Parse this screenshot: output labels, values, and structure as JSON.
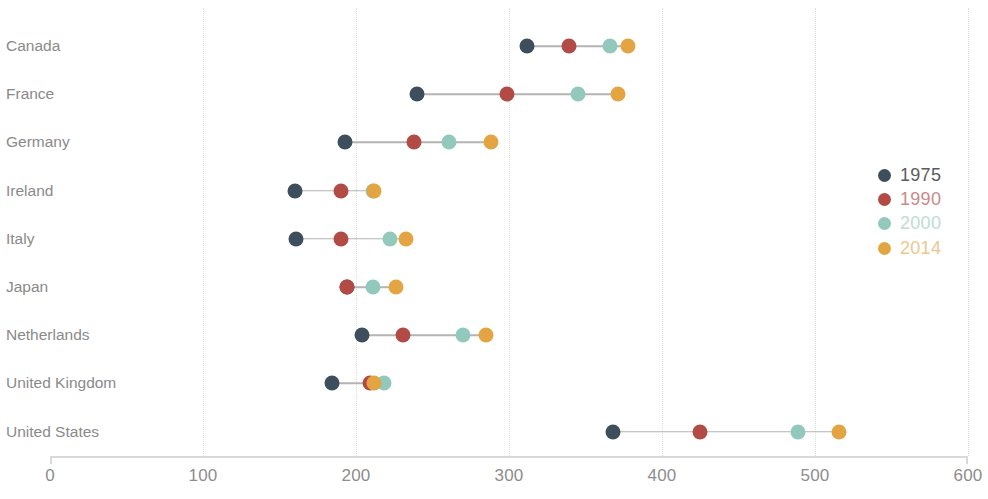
{
  "chart_data": {
    "type": "scatter",
    "subtype": "dot-plot",
    "title": "",
    "subtitle": "",
    "xlabel": "",
    "ylabel": "",
    "xlim": [
      0,
      600
    ],
    "xticks": [
      0,
      100,
      200,
      300,
      400,
      500,
      600
    ],
    "xtick_labels": [
      "0",
      "100",
      "200",
      "300",
      "400",
      "500",
      "600"
    ],
    "grid": "vertical-dotted",
    "legend_position": "right",
    "categories": [
      "Canada",
      "France",
      "Germany",
      "Ireland",
      "Italy",
      "Japan",
      "Netherlands",
      "United Kingdom",
      "United States"
    ],
    "series": [
      {
        "name": "1975",
        "color": "#3d4f5d",
        "values": [
          312,
          240,
          193,
          160,
          161,
          194,
          204,
          184,
          368
        ]
      },
      {
        "name": "1990",
        "color": "#b24a45",
        "values": [
          339,
          299,
          238,
          190,
          190,
          194,
          231,
          209,
          425
        ]
      },
      {
        "name": "2000",
        "color": "#93c9bd",
        "values": [
          366,
          345,
          261,
          211,
          222,
          211,
          270,
          218,
          489
        ]
      },
      {
        "name": "2014",
        "color": "#e3a542",
        "values": [
          378,
          371,
          288,
          212,
          233,
          226,
          285,
          212,
          516
        ]
      }
    ]
  },
  "legend": {
    "items": [
      {
        "label": "1975",
        "color": "#3d4f5d",
        "text_color": "#5b5b5b"
      },
      {
        "label": "1990",
        "color": "#b24a45",
        "text_color": "#c88b88"
      },
      {
        "label": "2000",
        "color": "#93c9bd",
        "text_color": "#bcdcd4"
      },
      {
        "label": "2014",
        "color": "#e3a542",
        "text_color": "#ecc78e"
      }
    ]
  },
  "axis": {
    "tick_color": "#8d8d8d",
    "line_color": "#d9d9d9",
    "gridline_color": "#dedede"
  }
}
